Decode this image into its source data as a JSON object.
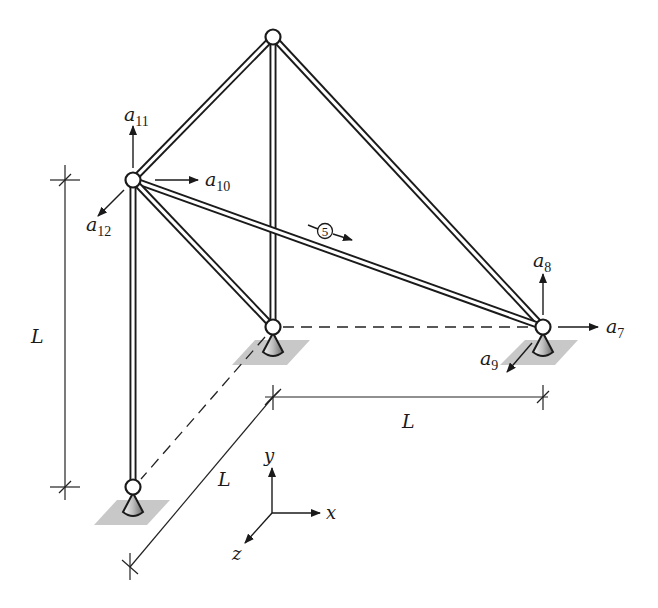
{
  "diagram": {
    "type": "3D space truss",
    "dimension_labels": {
      "vertical": "L",
      "horizontal": "L",
      "depth": "L"
    },
    "dof_labels": [
      {
        "id": "a7",
        "base": "a",
        "sub": "7",
        "direction": "+x",
        "node": "right-support"
      },
      {
        "id": "a8",
        "base": "a",
        "sub": "8",
        "direction": "+y",
        "node": "right-support"
      },
      {
        "id": "a9",
        "base": "a",
        "sub": "9",
        "direction": "+z",
        "node": "right-support"
      },
      {
        "id": "a10",
        "base": "a",
        "sub": "10",
        "direction": "+x",
        "node": "upper-left"
      },
      {
        "id": "a11",
        "base": "a",
        "sub": "11",
        "direction": "+y",
        "node": "upper-left"
      },
      {
        "id": "a12",
        "base": "a",
        "sub": "12",
        "direction": "+z",
        "node": "upper-left"
      }
    ],
    "element_label": "5",
    "axes": {
      "x": "x",
      "y": "y",
      "z": "z"
    },
    "colors": {
      "line": "#1a1a1a",
      "support_base": "#c8c8c8",
      "background": "#ffffff"
    }
  }
}
